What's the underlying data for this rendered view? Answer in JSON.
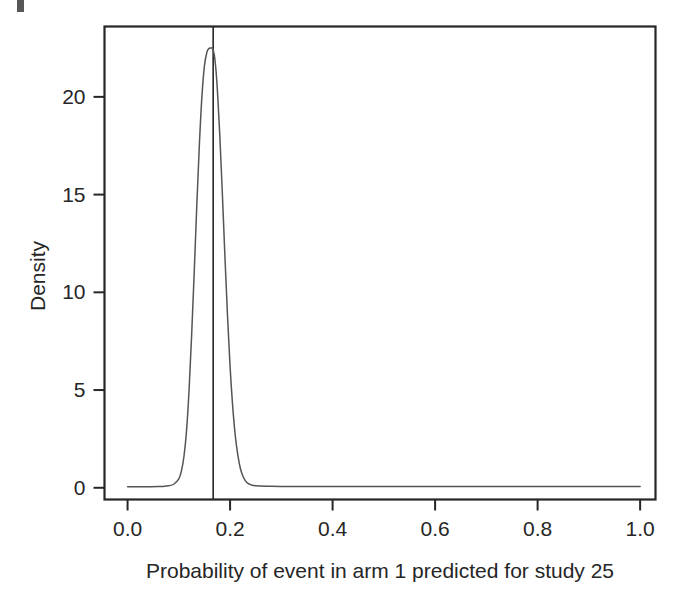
{
  "figure": {
    "background_color": "#ffffff",
    "ink_color": "#262626",
    "curve_color": "#555555"
  },
  "chart_data": {
    "type": "line",
    "title": "",
    "subtitle": "",
    "xlabel": "Probability of event in arm 1 predicted for study 25",
    "ylabel": "Density",
    "xlim": [
      -0.045,
      1.03
    ],
    "ylim": [
      -0.6,
      23.6
    ],
    "grid": false,
    "legend": null,
    "xticks": [
      0.0,
      0.2,
      0.4,
      0.6,
      0.8,
      1.0
    ],
    "xticklabels": [
      "0.0",
      "0.2",
      "0.4",
      "0.6",
      "0.8",
      "1.0"
    ],
    "yticks": [
      0,
      5,
      10,
      15,
      20
    ],
    "yticklabels": [
      "0",
      "5",
      "10",
      "15",
      "20"
    ],
    "annotations": [
      {
        "kind": "vertical-reference-line",
        "x": 0.167,
        "label": ""
      }
    ],
    "series": [
      {
        "name": "Posterior predictive density",
        "peak_x": 0.165,
        "peak_y": 22.5,
        "x": [
          0.0,
          0.02,
          0.04,
          0.06,
          0.07,
          0.08,
          0.09,
          0.1,
          0.105,
          0.11,
          0.115,
          0.12,
          0.125,
          0.13,
          0.135,
          0.14,
          0.145,
          0.15,
          0.155,
          0.158,
          0.161,
          0.163,
          0.165,
          0.167,
          0.17,
          0.173,
          0.176,
          0.18,
          0.185,
          0.19,
          0.195,
          0.2,
          0.205,
          0.21,
          0.215,
          0.22,
          0.225,
          0.23,
          0.235,
          0.24,
          0.25,
          0.28,
          0.32,
          0.4,
          0.5,
          0.6,
          0.7,
          0.8,
          0.9,
          1.0
        ],
        "y": [
          0.05,
          0.05,
          0.05,
          0.06,
          0.07,
          0.1,
          0.18,
          0.45,
          0.85,
          1.6,
          2.9,
          5.0,
          7.8,
          11.0,
          14.4,
          17.5,
          20.0,
          21.6,
          22.3,
          22.45,
          22.5,
          22.5,
          22.5,
          22.4,
          22.0,
          21.2,
          20.0,
          18.0,
          15.0,
          11.8,
          8.8,
          6.2,
          4.2,
          2.7,
          1.7,
          1.0,
          0.6,
          0.35,
          0.22,
          0.16,
          0.1,
          0.08,
          0.07,
          0.07,
          0.06,
          0.06,
          0.06,
          0.06,
          0.06,
          0.06
        ]
      }
    ]
  },
  "axes": {
    "x_axis_name": "x-axis",
    "y_axis_name": "y-axis"
  }
}
